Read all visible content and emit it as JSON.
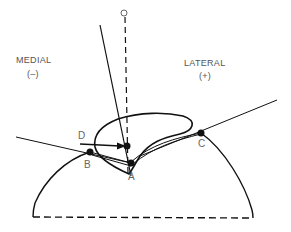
{
  "diagram": {
    "labels": {
      "top_point": "O",
      "medial": "MEDIAL",
      "medial_sign": "(–)",
      "lateral": "LATERAL",
      "lateral_sign": "(+)"
    },
    "points": {
      "A": "A",
      "B": "B",
      "C": "C",
      "D": "D"
    },
    "colors": {
      "stroke": "#111111",
      "text": "#555555",
      "background": "#ffffff"
    }
  }
}
